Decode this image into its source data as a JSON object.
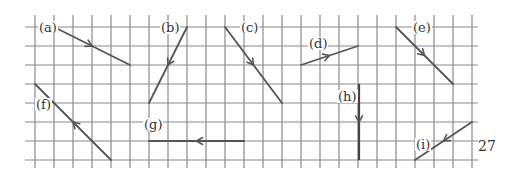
{
  "diagram": {
    "grid": {
      "x_lines": [
        35,
        54,
        73,
        92,
        111,
        130,
        149,
        168,
        187,
        206,
        225,
        244,
        263,
        282,
        301,
        320,
        339,
        358,
        377,
        396,
        415,
        434,
        453,
        472
      ],
      "y_lines": [
        27,
        46,
        65,
        84,
        103,
        122,
        141,
        160
      ],
      "x_extent": [
        25,
        478
      ],
      "y_extent": [
        15,
        168
      ],
      "color": "#8a8a8a"
    },
    "vector_color": "#555555",
    "vectors": [
      {
        "id": "a",
        "label": "(a)",
        "from": [
          54,
          27
        ],
        "to": [
          130,
          65
        ],
        "label_pos": [
          38,
          21
        ]
      },
      {
        "id": "b",
        "label": "(b)",
        "from": [
          187,
          27
        ],
        "to": [
          149,
          103
        ],
        "label_pos": [
          160,
          21
        ]
      },
      {
        "id": "c",
        "label": "(c)",
        "from": [
          225,
          27
        ],
        "to": [
          282,
          103
        ],
        "label_pos": [
          240,
          21
        ]
      },
      {
        "id": "d",
        "label": "(d)",
        "from": [
          301,
          65
        ],
        "to": [
          358,
          46
        ],
        "label_pos": [
          308,
          37
        ]
      },
      {
        "id": "e",
        "label": "(e)",
        "from": [
          396,
          27
        ],
        "to": [
          453,
          84
        ],
        "label_pos": [
          412,
          21
        ]
      },
      {
        "id": "f",
        "label": "(f)",
        "from": [
          111,
          160
        ],
        "to": [
          35,
          84
        ],
        "label_pos": [
          35,
          98
        ]
      },
      {
        "id": "g",
        "label": "(g)",
        "from": [
          244,
          141
        ],
        "to": [
          149,
          141
        ],
        "label_pos": [
          143,
          118
        ]
      },
      {
        "id": "h",
        "label": "(h)",
        "from": [
          359,
          84
        ],
        "to": [
          359,
          160
        ],
        "label_pos": [
          337,
          90
        ]
      },
      {
        "id": "i",
        "label": "(i)",
        "from": [
          472,
          122
        ],
        "to": [
          415,
          160
        ],
        "label_pos": [
          415,
          138
        ]
      }
    ],
    "page_number": "27"
  }
}
